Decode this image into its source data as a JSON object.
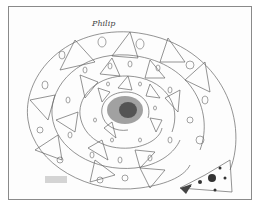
{
  "artwork": {
    "description": "Hand-drawn spiral mandala of triangles and circles on paper",
    "signature": "Philip",
    "colors": {
      "ink": "#555555",
      "paper": "#fdfdfd",
      "border": "#8a8a8a",
      "shading": "#333333"
    }
  }
}
